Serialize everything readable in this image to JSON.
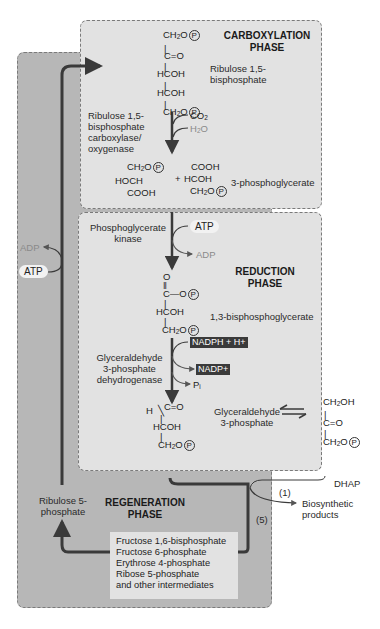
{
  "phases": {
    "carboxylation": "CARBOXYLATION PHASE",
    "reduction": "REDUCTION PHASE",
    "regeneration": "REGENERATION PHASE"
  },
  "carboxylation": {
    "rubp_structure": [
      "CH2O(P)",
      "C=O",
      "HCOH",
      "HCOH",
      "CH2O(P)"
    ],
    "rubp_name": "Ribulose 1,5-bisphosphate",
    "enzyme": "Ribulose 1,5-bisphosphate carboxylase/ oxygenase",
    "inputs": [
      "CO2",
      "H2O"
    ],
    "product_left": [
      "CH2O(P)",
      "HOCH",
      "COOH"
    ],
    "plus": "+",
    "product_right": [
      "COOH",
      "HCOH",
      "CH2O(P)"
    ],
    "product_name": "3-phosphoglycerate"
  },
  "reduction": {
    "enzyme1": "Phosphoglycerate kinase",
    "atp_in": "ATP",
    "adp_out": "ADP",
    "bpg_structure": [
      "O",
      "C—O(P)",
      "HCOH",
      "CH2O(P)"
    ],
    "bpg_name": "1,3-bisphosphoglycerate",
    "enzyme2": "Glyceraldehyde 3-phosphate dehydrogenase",
    "nadph_in": "NADPH + H+",
    "nadp_out": "NADP+",
    "pi_out": "Pi",
    "g3p_structure": [
      "H",
      "C=O",
      "HCOH",
      "CH2O(P)"
    ],
    "g3p_name": "Glyceraldehyde 3-phosphate"
  },
  "dhap": {
    "structure": [
      "CH2OH",
      "C=O",
      "CH2O(P)"
    ],
    "name": "DHAP"
  },
  "regeneration": {
    "ru5p": "Ribulose 5-phosphate",
    "atp_in": "ATP",
    "adp_out": "ADP",
    "branch_1": "(1)",
    "branch_5": "(5)",
    "biosynthetic": "Biosynthetic products",
    "intermediates": [
      "Fructose 1,6-bisphosphate",
      "Fructose 6-phosphate",
      "Erythrose 4-phosphate",
      "Ribose 5-phosphate",
      "and other intermediates"
    ]
  },
  "colors": {
    "regen_bg": "#b7b7b7",
    "phase_bg": "#e2e2e2",
    "arrow": "#3a3a3a",
    "faded_text": "#8a8a8a"
  }
}
